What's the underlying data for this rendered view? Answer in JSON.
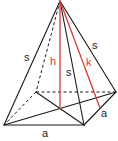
{
  "diagram": {
    "type": "square-pyramid",
    "colors": {
      "edge": "#1a1a1a",
      "highlight": "#d9393e",
      "background": "#ffffff"
    },
    "vertices": {
      "apex": [
        60,
        1
      ],
      "front_left": [
        4,
        125
      ],
      "front_right": [
        84,
        125
      ],
      "back_right": [
        116,
        92
      ],
      "back_left": [
        36,
        92
      ],
      "base_center": [
        60,
        109
      ],
      "right_edge_mid": [
        100,
        108
      ]
    },
    "labels": {
      "lateral_edge_left": "s",
      "lateral_edge_front": "s",
      "lateral_edge_right": "s",
      "height": "h",
      "slant_height": "k",
      "base_edge_front": "a",
      "base_edge_right": "a"
    }
  }
}
